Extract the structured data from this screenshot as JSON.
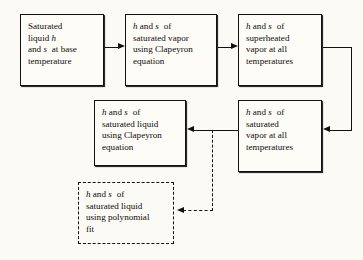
{
  "diagram": {
    "background_color": "#fbfaf4",
    "line_color": "#111111",
    "boxes": [
      {
        "id": "saturated-liquid-base",
        "style": "solid",
        "lines": [
          "Saturated",
          "liquid h",
          "and s at base",
          "temperature"
        ]
      },
      {
        "id": "saturated-vapor-clapeyron",
        "style": "solid",
        "lines": [
          "h and s of",
          "saturated vapor",
          "using Clapeyron",
          "equation"
        ]
      },
      {
        "id": "superheated-vapor",
        "style": "solid",
        "lines": [
          "h and s of",
          "superheated",
          "vapor at all",
          "temperatures"
        ]
      },
      {
        "id": "saturated-liquid-clapeyron",
        "style": "solid",
        "lines": [
          "h and s of",
          "saturated liquid",
          "using Clapeyron",
          "equation"
        ]
      },
      {
        "id": "saturated-vapor-all",
        "style": "solid",
        "lines": [
          "h and s of",
          "saturated",
          "vapor at all",
          "temperatures"
        ]
      },
      {
        "id": "polynomial-fit",
        "style": "dashed",
        "lines": [
          "h and s of",
          "saturated liquid",
          "using polynomial",
          "fit"
        ]
      }
    ],
    "connectors": [
      {
        "id": "base-to-vapor-clapeyron",
        "style": "solid",
        "from": "saturated-liquid-base",
        "to": "saturated-vapor-clapeyron",
        "direction": "right"
      },
      {
        "id": "vapor-clapeyron-to-superheated",
        "style": "solid",
        "from": "saturated-vapor-clapeyron",
        "to": "superheated-vapor",
        "direction": "right"
      },
      {
        "id": "superheated-to-saturated-vapor-all",
        "style": "solid",
        "from": "superheated-vapor",
        "to": "saturated-vapor-all",
        "direction": "left"
      },
      {
        "id": "saturated-vapor-all-to-liquid-clapeyron",
        "style": "solid",
        "from": "saturated-vapor-all",
        "to": "saturated-liquid-clapeyron",
        "direction": "left"
      },
      {
        "id": "branch-to-polynomial-fit",
        "style": "dashed",
        "from": "saturated-vapor-all-to-liquid-clapeyron",
        "to": "polynomial-fit",
        "direction": "left"
      }
    ]
  }
}
